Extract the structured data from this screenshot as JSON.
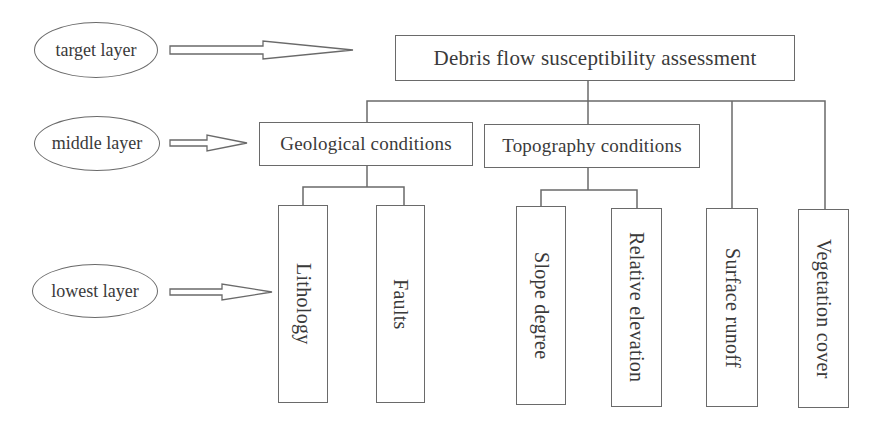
{
  "layers": [
    {
      "id": "target",
      "label": "target layer"
    },
    {
      "id": "middle",
      "label": "middle layer"
    },
    {
      "id": "lowest",
      "label": "lowest layer"
    }
  ],
  "target": {
    "label": "Debris flow susceptibility assessment"
  },
  "middle": [
    {
      "label": "Geological conditions"
    },
    {
      "label": "Topography conditions"
    }
  ],
  "lowest": [
    {
      "label": "Lithology",
      "parent": "Geological conditions"
    },
    {
      "label": "Faults",
      "parent": "Geological conditions"
    },
    {
      "label": "Slope degree",
      "parent": "Topography conditions"
    },
    {
      "label": "Relative elevation",
      "parent": "Topography conditions"
    },
    {
      "label": "Surface runoff",
      "parent": "Debris flow susceptibility assessment"
    },
    {
      "label": "Vegetation cover",
      "parent": "Debris flow susceptibility assessment"
    }
  ],
  "colors": {
    "stroke": "#6a6a6a",
    "text": "#3a3a3a",
    "background": "#ffffff"
  }
}
